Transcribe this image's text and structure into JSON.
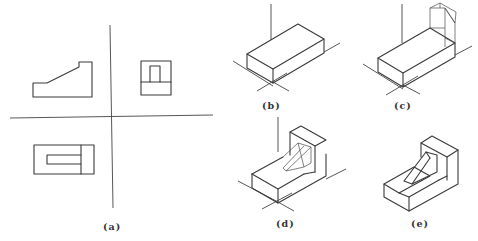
{
  "figure": {
    "panels": [
      {
        "id": "a",
        "label": "(a)",
        "description": "Three-view orthographic projection: front view, side view, top view"
      },
      {
        "id": "b",
        "label": "(b)",
        "description": "Isometric base block with axes"
      },
      {
        "id": "c",
        "label": "(c)",
        "description": "Base block with upright block added (thin construction lines)"
      },
      {
        "id": "d",
        "label": "(d)",
        "description": "Wedge rib construction on L-shaped body"
      },
      {
        "id": "e",
        "label": "(e)",
        "description": "Finished isometric part"
      }
    ]
  },
  "colors": {
    "background": "#ffffff",
    "line": "#3a3a3a"
  }
}
